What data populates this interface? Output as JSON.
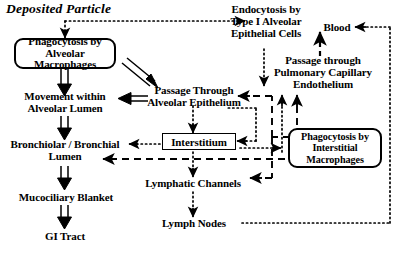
{
  "diagram": {
    "title": "Deposited Particle",
    "type": "flowchart",
    "colors": {
      "stroke": "#000000",
      "background": "#ffffff"
    },
    "nodes": [
      {
        "id": "deposited_particle",
        "label": "Deposited Particle",
        "shape": "text-italic"
      },
      {
        "id": "phagocytosis_alveolar",
        "label": "Phagocytosis by\nAlveolar Macrophages",
        "shape": "rounded-box"
      },
      {
        "id": "endocytosis_type1",
        "label": "Endocytosis by\nType I Alveolar\nEpithelial Cells",
        "shape": "text"
      },
      {
        "id": "blood",
        "label": "Blood",
        "shape": "text"
      },
      {
        "id": "movement_alveolar_lumen",
        "label": "Movement within\nAlveolar Lumen",
        "shape": "text"
      },
      {
        "id": "passage_alveolar_epithelium",
        "label": "Passage Through\nAlveolar Epithelium",
        "shape": "text"
      },
      {
        "id": "passage_pulmonary_capillary",
        "label": "Passage through\nPulmonary Capillary\nEndothelium",
        "shape": "text"
      },
      {
        "id": "bronchiolar_bronchial_lumen",
        "label": "Bronchiolar / Bronchial\nLumen",
        "shape": "text"
      },
      {
        "id": "interstitium",
        "label": "Interstitium",
        "shape": "rect-box"
      },
      {
        "id": "phagocytosis_interstitial",
        "label": "Phagocytosis by\nInterstitial\nMacrophages",
        "shape": "rounded-box"
      },
      {
        "id": "mucociliary_blanket",
        "label": "Mucociliary Blanket",
        "shape": "text"
      },
      {
        "id": "lymphatic_channels",
        "label": "Lymphatic Channels",
        "shape": "text"
      },
      {
        "id": "gi_tract",
        "label": "GI Tract",
        "shape": "text"
      },
      {
        "id": "lymph_nodes",
        "label": "Lymph Nodes",
        "shape": "text"
      }
    ],
    "edges": [
      {
        "from": "deposited_particle",
        "to": "phagocytosis_alveolar",
        "style": "dotted"
      },
      {
        "from": "deposited_particle",
        "to": "endocytosis_type1",
        "style": "dotted"
      },
      {
        "from": "phagocytosis_alveolar",
        "to": "movement_alveolar_lumen",
        "style": "hollow"
      },
      {
        "from": "phagocytosis_alveolar",
        "to": "passage_alveolar_epithelium",
        "style": "hollow"
      },
      {
        "from": "passage_alveolar_epithelium",
        "to": "movement_alveolar_lumen",
        "style": "hollow"
      },
      {
        "from": "endocytosis_type1",
        "to": "passage_alveolar_epithelium",
        "style": "dotted"
      },
      {
        "from": "movement_alveolar_lumen",
        "to": "bronchiolar_bronchial_lumen",
        "style": "hollow"
      },
      {
        "from": "bronchiolar_bronchial_lumen",
        "to": "mucociliary_blanket",
        "style": "hollow"
      },
      {
        "from": "mucociliary_blanket",
        "to": "gi_tract",
        "style": "hollow"
      },
      {
        "from": "passage_alveolar_epithelium",
        "to": "interstitium",
        "style": "dotted"
      },
      {
        "from": "interstitium",
        "to": "bronchiolar_bronchial_lumen",
        "style": "dotted"
      },
      {
        "from": "interstitium",
        "to": "bronchiolar_bronchial_lumen",
        "style": "dashed"
      },
      {
        "from": "interstitium",
        "to": "lymphatic_channels",
        "style": "dotted"
      },
      {
        "from": "interstitium",
        "to": "phagocytosis_interstitial",
        "style": "dotted"
      },
      {
        "from": "phagocytosis_interstitial",
        "to": "interstitium",
        "style": "dotted"
      },
      {
        "from": "phagocytosis_interstitial",
        "to": "passage_alveolar_epithelium",
        "style": "dashed"
      },
      {
        "from": "phagocytosis_interstitial",
        "to": "lymphatic_channels",
        "style": "dashed"
      },
      {
        "from": "interstitium",
        "to": "passage_pulmonary_capillary",
        "style": "dotted"
      },
      {
        "from": "phagocytosis_interstitial",
        "to": "passage_pulmonary_capillary",
        "style": "dashed"
      },
      {
        "from": "passage_pulmonary_capillary",
        "to": "blood",
        "style": "dashed-solid"
      },
      {
        "from": "lymphatic_channels",
        "to": "lymph_nodes",
        "style": "dotted"
      },
      {
        "from": "lymph_nodes",
        "to": "blood",
        "style": "dotted"
      }
    ]
  }
}
